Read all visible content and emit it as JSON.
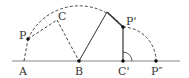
{
  "diagram": {
    "type": "geometry-rotation",
    "colors": {
      "stroke": "#333333",
      "baseline": "#888888",
      "background": "#ffffff"
    },
    "points": {
      "A": {
        "label": "A",
        "x": 24,
        "y": 61
      },
      "B": {
        "label": "B",
        "x": 79,
        "y": 61
      },
      "Cp": {
        "label": "C'",
        "x": 123,
        "y": 61
      },
      "Ppp": {
        "label": "P″",
        "x": 156,
        "y": 61
      },
      "P": {
        "label": "P",
        "x": 28,
        "y": 39
      },
      "C": {
        "label": "C",
        "x": 57,
        "y": 20
      },
      "Pp": {
        "label": "P'",
        "x": 123,
        "y": 27
      },
      "T": {
        "label": "",
        "x": 107,
        "y": 12
      }
    },
    "labels": {
      "A": "A",
      "B": "B",
      "C": "C",
      "P": "P",
      "Pp": "P'",
      "Cp": "C'",
      "Ppp": "P″"
    }
  }
}
